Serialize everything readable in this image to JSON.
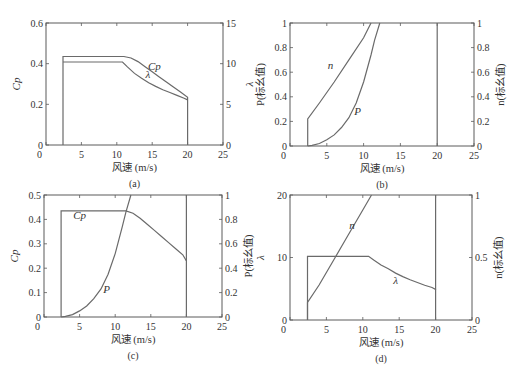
{
  "chart_data": [
    {
      "id": "a",
      "type": "line",
      "caption": "(a)",
      "xlabel": "风速 (m/s)",
      "xlim": [
        0,
        25
      ],
      "xticks": [
        0,
        5,
        10,
        15,
        20,
        25
      ],
      "ylabel_left": "Cp",
      "ylim_left": [
        0,
        0.6
      ],
      "yticks_left": [
        "0",
        "0.2",
        "0.4",
        "0.6"
      ],
      "ylabel_right": "λ",
      "ylim_right": [
        0,
        15
      ],
      "yticks_right": [
        "0",
        "5",
        "10",
        "15"
      ],
      "series": [
        {
          "name": "Cp",
          "axis": "left",
          "label": "Cp",
          "label_at": [
            15.3,
            0.37
          ],
          "points": [
            [
              2.4,
              0
            ],
            [
              2.4,
              0.435
            ],
            [
              11,
              0.435
            ],
            [
              12,
              0.428
            ],
            [
              13,
              0.41
            ],
            [
              14,
              0.385
            ],
            [
              15,
              0.36
            ],
            [
              16,
              0.335
            ],
            [
              17,
              0.31
            ],
            [
              18,
              0.285
            ],
            [
              19,
              0.26
            ],
            [
              20,
              0.235
            ],
            [
              20,
              0
            ]
          ]
        },
        {
          "name": "λ",
          "axis": "right",
          "label": "λ",
          "label_at": [
            14.4,
            8.2
          ],
          "points": [
            [
              2.4,
              10.2
            ],
            [
              10.8,
              10.2
            ],
            [
              11.5,
              9.6
            ],
            [
              12.5,
              8.8
            ],
            [
              13.5,
              8.2
            ],
            [
              14.5,
              7.65
            ],
            [
              15.5,
              7.2
            ],
            [
              16.5,
              6.8
            ],
            [
              17.5,
              6.45
            ],
            [
              18.5,
              6.1
            ],
            [
              19.5,
              5.75
            ],
            [
              20,
              5.55
            ]
          ]
        }
      ]
    },
    {
      "id": "b",
      "type": "line",
      "caption": "(b)",
      "xlabel": "风速 (m/s)",
      "xlim": [
        0,
        25
      ],
      "xticks": [
        0,
        5,
        10,
        15,
        20,
        25
      ],
      "ylabel_left": "P(标幺值)",
      "ylim_left": [
        0,
        1
      ],
      "yticks_left": [
        "0",
        "0.2",
        "0.4",
        "0.6",
        "0.8",
        "1"
      ],
      "ylabel_right": "n(标幺值)",
      "ylim_right": [
        0,
        1
      ],
      "yticks_right": [
        "0",
        "0.2",
        "0.4",
        "0.6",
        "0.8",
        "1"
      ],
      "series": [
        {
          "name": "n",
          "axis": "right",
          "label": "n",
          "label_at": [
            5.5,
            0.63
          ],
          "points": [
            [
              2.4,
              0
            ],
            [
              2.4,
              0.22
            ],
            [
              4,
              0.35
            ],
            [
              6,
              0.52
            ],
            [
              8,
              0.7
            ],
            [
              10,
              0.88
            ],
            [
              11,
              1.0
            ]
          ]
        },
        {
          "name": "P",
          "axis": "left",
          "label": "P",
          "label_at": [
            9.2,
            0.25
          ],
          "points": [
            [
              2.4,
              0
            ],
            [
              3,
              0.005
            ],
            [
              4,
              0.02
            ],
            [
              5,
              0.05
            ],
            [
              6,
              0.09
            ],
            [
              7,
              0.15
            ],
            [
              8,
              0.23
            ],
            [
              9,
              0.35
            ],
            [
              10,
              0.52
            ],
            [
              11,
              0.74
            ],
            [
              11.5,
              0.86
            ],
            [
              12.2,
              1.0
            ]
          ]
        },
        {
          "name": "cut-out",
          "axis": "left",
          "points": [
            [
              20,
              0
            ],
            [
              20,
              1
            ]
          ]
        }
      ]
    },
    {
      "id": "c",
      "type": "line",
      "caption": "(c)",
      "xlabel": "风速 (m/s)",
      "xlim": [
        0,
        25
      ],
      "xticks": [
        0,
        5,
        10,
        15,
        20,
        25
      ],
      "ylabel_left": "Cp",
      "ylim_left": [
        0,
        0.5
      ],
      "yticks_left": [
        "0",
        "0.1",
        "0.2",
        "0.3",
        "0.4",
        "0.5"
      ],
      "ylabel_right": "P(标幺值)",
      "ylim_right": [
        0,
        1
      ],
      "yticks_right": [
        "0",
        "0.2",
        "0.4",
        "0.6",
        "0.8",
        "1"
      ],
      "series": [
        {
          "name": "Cp",
          "axis": "left",
          "label": "Cp",
          "label_at": [
            5,
            0.4
          ],
          "points": [
            [
              2.4,
              0
            ],
            [
              2.4,
              0.435
            ],
            [
              11.5,
              0.435
            ],
            [
              12.5,
              0.425
            ],
            [
              13.5,
              0.405
            ],
            [
              14.5,
              0.38
            ],
            [
              15.5,
              0.355
            ],
            [
              16.5,
              0.33
            ],
            [
              17.5,
              0.305
            ],
            [
              18.5,
              0.28
            ],
            [
              19.5,
              0.255
            ],
            [
              20,
              0.23
            ],
            [
              20,
              0
            ]
          ]
        },
        {
          "name": "P",
          "axis": "right",
          "label": "P",
          "label_at": [
            8.8,
            0.2
          ],
          "points": [
            [
              2.4,
              0
            ],
            [
              3,
              0.005
            ],
            [
              4,
              0.02
            ],
            [
              5,
              0.05
            ],
            [
              6,
              0.09
            ],
            [
              7,
              0.15
            ],
            [
              8,
              0.23
            ],
            [
              9,
              0.35
            ],
            [
              10,
              0.52
            ],
            [
              11,
              0.74
            ],
            [
              11.5,
              0.86
            ],
            [
              12.2,
              1.0
            ]
          ]
        },
        {
          "name": "cut-out",
          "axis": "left",
          "points": [
            [
              20,
              0.23
            ],
            [
              20,
              0.5
            ]
          ]
        }
      ]
    },
    {
      "id": "d",
      "type": "line",
      "caption": "(d)",
      "xlabel": "风速 (m/s)",
      "xlim": [
        0,
        25
      ],
      "xticks": [
        0,
        5,
        10,
        15,
        20,
        25
      ],
      "ylabel_left": "λ",
      "ylim_left": [
        0,
        20
      ],
      "yticks_left": [
        "0",
        "10",
        "20"
      ],
      "ylabel_right": "n(标幺值)",
      "ylim_right": [
        0,
        1
      ],
      "yticks_right": [
        "0",
        "0.5",
        "1"
      ],
      "series": [
        {
          "name": "λ",
          "axis": "left",
          "label": "λ",
          "label_at": [
            14.5,
            5.8
          ],
          "points": [
            [
              2.4,
              0
            ],
            [
              2.4,
              10.2
            ],
            [
              10.8,
              10.2
            ],
            [
              11.5,
              9.6
            ],
            [
              12.5,
              8.8
            ],
            [
              13.5,
              8.2
            ],
            [
              14.5,
              7.5
            ],
            [
              15.5,
              6.95
            ],
            [
              16.5,
              6.45
            ],
            [
              17.5,
              6.0
            ],
            [
              18.5,
              5.55
            ],
            [
              19.5,
              5.2
            ],
            [
              20,
              4.9
            ],
            [
              20,
              0
            ]
          ]
        },
        {
          "name": "n",
          "axis": "right",
          "label": "n",
          "label_at": [
            8.5,
            0.73
          ],
          "points": [
            [
              2.4,
              0
            ],
            [
              2.4,
              0.14
            ],
            [
              4,
              0.28
            ],
            [
              6,
              0.48
            ],
            [
              8,
              0.68
            ],
            [
              10,
              0.88
            ],
            [
              11.2,
              1.0
            ]
          ]
        },
        {
          "name": "cut-out",
          "axis": "left",
          "points": [
            [
              20,
              4.9
            ],
            [
              20,
              20
            ]
          ]
        }
      ]
    }
  ]
}
